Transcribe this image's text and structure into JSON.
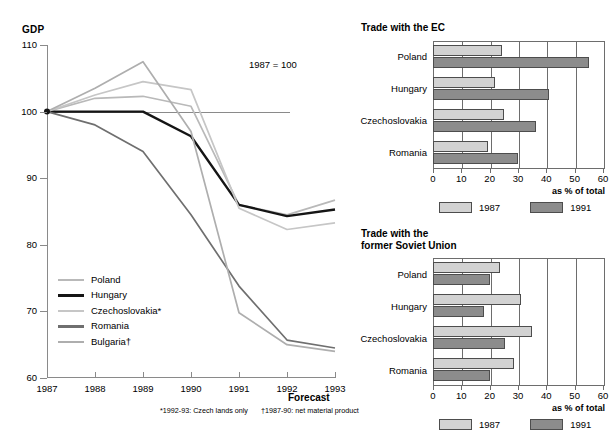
{
  "line_chart": {
    "y_axis_title": "GDP",
    "annotation": "1987 = 100",
    "forecast_label": "Forecast",
    "footnotes": [
      "*1992-93: Czech lands only",
      "†1987-90: net material product"
    ],
    "legend": [
      {
        "label": "Poland",
        "color": "#b9b9b9"
      },
      {
        "label": "Hungary",
        "color": "#151515"
      },
      {
        "label": "Czechoslovakia*",
        "color": "#c6c6c6"
      },
      {
        "label": "Romania",
        "color": "#6f6f6f"
      },
      {
        "label": "Bulgaria†",
        "color": "#aeaeae"
      }
    ]
  },
  "chart_data": [
    {
      "type": "line",
      "title": "GDP",
      "xlabel": "",
      "ylabel": "GDP",
      "annotation": "1987 = 100",
      "x": [
        "1987",
        "1988",
        "1989",
        "1990",
        "1991",
        "1992",
        "1993"
      ],
      "ylim": [
        60,
        110
      ],
      "yticks": [
        60,
        70,
        80,
        90,
        100,
        110
      ],
      "grid": false,
      "legend_position": "inside-lower-left",
      "series": [
        {
          "name": "Poland",
          "color": "#b9b9b9",
          "values": [
            100,
            102.0,
            102.3,
            100.8,
            86.0,
            84.5,
            86.7
          ]
        },
        {
          "name": "Hungary",
          "color": "#151515",
          "values": [
            100,
            100.0,
            100.0,
            96.3,
            86.0,
            84.3,
            85.3
          ]
        },
        {
          "name": "Czechoslovakia*",
          "color": "#c6c6c6",
          "values": [
            100,
            102.5,
            104.5,
            103.3,
            85.5,
            82.3,
            83.3
          ]
        },
        {
          "name": "Romania",
          "color": "#6f6f6f",
          "values": [
            100,
            98.0,
            94.0,
            84.5,
            73.8,
            65.7,
            64.5
          ]
        },
        {
          "name": "Bulgaria†",
          "color": "#aeaeae",
          "values": [
            100,
            103.5,
            107.5,
            97.0,
            69.8,
            65.0,
            64.0
          ]
        }
      ]
    },
    {
      "type": "bar",
      "orientation": "horizontal",
      "title": "Trade with the EC",
      "xlabel": "as % of total",
      "xlim": [
        0,
        60
      ],
      "xticks": [
        0,
        10,
        20,
        30,
        40,
        50,
        60
      ],
      "categories": [
        "Poland",
        "Hungary",
        "Czechoslovakia",
        "Romania"
      ],
      "series": [
        {
          "name": "1987",
          "color": "#d2d2d2",
          "values": [
            24.5,
            22.0,
            25.0,
            19.5
          ]
        },
        {
          "name": "1991",
          "color": "#8c8c8c",
          "values": [
            55.0,
            41.0,
            36.5,
            30.0
          ]
        }
      ]
    },
    {
      "type": "bar",
      "orientation": "horizontal",
      "title": "Trade with the former Soviet Union",
      "xlabel": "as % of total",
      "xlim": [
        0,
        60
      ],
      "xticks": [
        0,
        10,
        20,
        30,
        40,
        50,
        60
      ],
      "categories": [
        "Poland",
        "Hungary",
        "Czechoslovakia",
        "Romania"
      ],
      "series": [
        {
          "name": "1987",
          "color": "#d2d2d2",
          "values": [
            23.5,
            31.0,
            35.0,
            28.5
          ]
        },
        {
          "name": "1991",
          "color": "#8c8c8c",
          "values": [
            20.0,
            18.0,
            25.5,
            20.0
          ]
        }
      ]
    }
  ],
  "bars_ec": {
    "title_line1": "Trade with the EC",
    "title_line2": "",
    "unit": "as % of total",
    "legend": [
      {
        "label": "1987"
      },
      {
        "label": "1991"
      }
    ]
  },
  "bars_su": {
    "title_line1": "Trade with the",
    "title_line2": "former Soviet Union",
    "unit": "as % of total",
    "legend": [
      {
        "label": "1987"
      },
      {
        "label": "1991"
      }
    ]
  }
}
